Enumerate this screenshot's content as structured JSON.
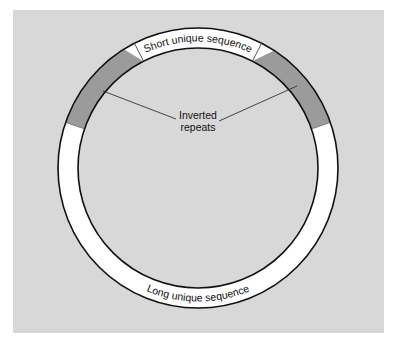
{
  "figure": {
    "background": "#ffffff",
    "panel": {
      "x": 13,
      "y": 10,
      "width": 371,
      "height": 323,
      "color": "#d8d8d8"
    },
    "ring": {
      "cx": 198,
      "cy": 168,
      "outer_r": 140,
      "inner_r": 120,
      "fill": "#ffffff",
      "stroke": "#111111",
      "stroke_width": 1.6
    },
    "segments": {
      "short_unique": {
        "label": "Short unique sequence",
        "start_deg": -27,
        "end_deg": 27
      },
      "long_unique": {
        "label": "Long unique sequence",
        "start_deg": 71,
        "end_deg": 289
      },
      "inverted_repeats": {
        "label_line1": "Inverted",
        "label_line2": "repeats",
        "color": "#9b9b9b",
        "left": {
          "tail_deg": -71,
          "outer_end_deg": -32,
          "tip_deg": -27.5,
          "inner_end_deg": -29
        },
        "right": {
          "tail_deg": 71,
          "outer_end_deg": 33,
          "tip_deg": 27.5,
          "inner_end_deg": 29
        }
      }
    },
    "leaders": [
      {
        "x1": 103,
        "y1": 91,
        "x2": 176,
        "y2": 119
      },
      {
        "x1": 297,
        "y1": 86,
        "x2": 219,
        "y2": 121
      }
    ],
    "leader_color": "#333333"
  }
}
